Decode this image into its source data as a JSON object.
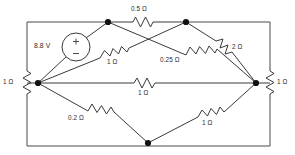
{
  "diagram": {
    "source": {
      "name": "voltage-source",
      "value": "8.8 V",
      "plus": "+",
      "minus": "–"
    },
    "resistors": [
      {
        "id": "r-top-middle",
        "label": "0.5 Ω",
        "from": "top-left-node",
        "to": "top-right-node"
      },
      {
        "id": "r-left-side",
        "label": "1 Ω",
        "from": "outer-left-top",
        "to": "outer-left-bottom"
      },
      {
        "id": "r-right-side",
        "label": "1 Ω",
        "from": "outer-right-top",
        "to": "outer-right-bottom"
      },
      {
        "id": "r-upper-left",
        "label": "1 Ω",
        "from": "left-node",
        "to": "top-right-node"
      },
      {
        "id": "r-upper-right",
        "label": "0.25 Ω",
        "from": "top-left-node",
        "to": "right-node"
      },
      {
        "id": "r-top-right",
        "label": "2 Ω",
        "from": "top-right-node",
        "to": "right-node"
      },
      {
        "id": "r-middle",
        "label": "1 Ω",
        "from": "left-node",
        "to": "right-node"
      },
      {
        "id": "r-lower-left",
        "label": "0.2 Ω",
        "from": "left-node",
        "to": "bottom-node"
      },
      {
        "id": "r-lower-right",
        "label": "1 Ω",
        "from": "bottom-node",
        "to": "right-node"
      }
    ],
    "nodes": [
      {
        "id": "top-left-node",
        "x": 108,
        "y": 22
      },
      {
        "id": "top-right-node",
        "x": 186,
        "y": 22
      },
      {
        "id": "left-node",
        "x": 38,
        "y": 83
      },
      {
        "id": "right-node",
        "x": 256,
        "y": 83
      },
      {
        "id": "bottom-node",
        "x": 148,
        "y": 143
      }
    ],
    "colors": {
      "wire": "#3a3a3a",
      "frame": "#4a4a4a",
      "node": "#111111",
      "text": "#2b2b2b",
      "background": "#ffffff"
    }
  }
}
